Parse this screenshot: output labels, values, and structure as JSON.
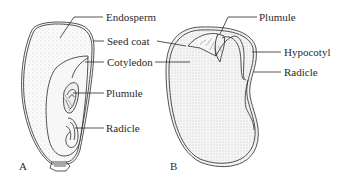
{
  "figure": {
    "panels": [
      {
        "id": "A",
        "label": "A",
        "subject": "corn seed (monocot)",
        "parts": [
          "Endosperm",
          "Seed coat",
          "Cotyledon",
          "Plumule",
          "Radicle"
        ]
      },
      {
        "id": "B",
        "label": "B",
        "subject": "bean seed (dicot)",
        "parts": [
          "Plumule",
          "Seed coat",
          "Cotyledon",
          "Hypocotyl",
          "Radicle"
        ]
      }
    ],
    "labels": {
      "endosperm": "Endosperm",
      "seed_coat": "Seed coat",
      "cotyledon": "Cotyledon",
      "plumule_a": "Plumule",
      "radicle_a": "Radicle",
      "plumule_b": "Plumule",
      "hypocotyl": "Hypocotyl",
      "radicle_b": "Radicle"
    },
    "panel_labels": {
      "a": "A",
      "b": "B"
    },
    "colors": {
      "line": "#2a2a2a",
      "fill": "#f2f2f2",
      "stipple": "#9a9a9a",
      "background": "#ffffff"
    }
  }
}
